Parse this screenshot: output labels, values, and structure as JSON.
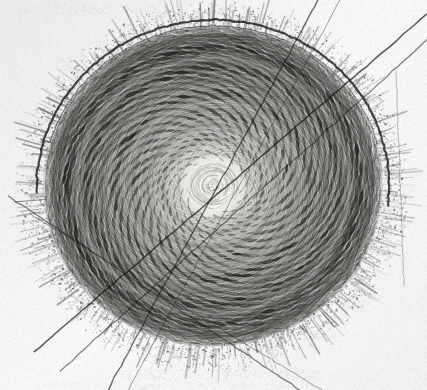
{
  "image": {
    "kind": "scanned-halftone-engraving",
    "subject_label": "sunflower-seed-head-phyllotaxis",
    "width": 427,
    "height": 390,
    "paper_background_hex": "#f7f7f8",
    "ink_hex": "#20201e",
    "midtone_hex": "#6d6d6a",
    "highlight_hex": "#f2f2ee"
  },
  "chart_data": {
    "type": "scatter",
    "title": "",
    "subtitle": "",
    "xlabel": "",
    "ylabel": "",
    "grid": false,
    "legend_position": "none",
    "annotations": [],
    "center_x": 213,
    "center_y": 186,
    "radius_x": 178,
    "radius_y": 168,
    "rotation_deg": -4,
    "floret_count": 1650,
    "golden_angle_deg": 137.508,
    "parastichy_counts": [
      34,
      55
    ],
    "core_radius": 34,
    "core_highlight_radius": 26,
    "disc_rim_radius_factor": 0.93,
    "bract_halo_thickness": 26,
    "bract_spike_count": 300,
    "scratch_lines": [
      {
        "x1": 427,
        "y1": 14,
        "x2": 34,
        "y2": 352,
        "width": 1.5,
        "alpha": 0.72
      },
      {
        "x1": 427,
        "y1": 40,
        "x2": 60,
        "y2": 371,
        "width": 1.2,
        "alpha": 0.55
      },
      {
        "x1": 318,
        "y1": 0,
        "x2": 108,
        "y2": 390,
        "width": 1.4,
        "alpha": 0.62
      },
      {
        "x1": 340,
        "y1": 0,
        "x2": 128,
        "y2": 390,
        "width": 1.0,
        "alpha": 0.4
      },
      {
        "x1": 8,
        "y1": 196,
        "x2": 300,
        "y2": 390,
        "width": 1.3,
        "alpha": 0.52
      },
      {
        "x1": 30,
        "y1": 214,
        "x2": 322,
        "y2": 390,
        "width": 1.0,
        "alpha": 0.38
      },
      {
        "x1": 396,
        "y1": 70,
        "x2": 404,
        "y2": 286,
        "width": 0.9,
        "alpha": 0.3
      }
    ],
    "arc_strokes": [
      {
        "cx": 213,
        "cy": 186,
        "rx": 176,
        "ry": 166,
        "rot": -4,
        "a0": 182,
        "a1": 372,
        "width": 2.2,
        "alpha": 0.8
      },
      {
        "cx": 213,
        "cy": 186,
        "rx": 170,
        "ry": 160,
        "rot": -4,
        "a0": 200,
        "a1": 350,
        "width": 1.2,
        "alpha": 0.45
      }
    ],
    "ghost_marks": [
      {
        "x": 18,
        "y": 4,
        "w": 210,
        "h": 9,
        "alpha": 0.05
      },
      {
        "x": 150,
        "y": 12,
        "w": 120,
        "h": 7,
        "alpha": 0.04
      },
      {
        "x": 120,
        "y": 369,
        "w": 200,
        "h": 11,
        "alpha": 0.085
      },
      {
        "x": 30,
        "y": 381,
        "w": 260,
        "h": 7,
        "alpha": 0.04
      }
    ]
  },
  "render": {
    "grain_opacity": 0.22,
    "grain_cell": 1,
    "vignette_alpha": 0.05,
    "seed": 20250714
  }
}
